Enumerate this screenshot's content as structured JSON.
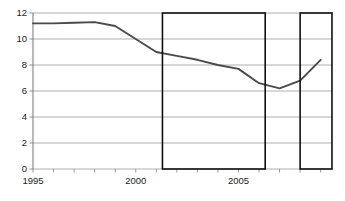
{
  "chart_data": {
    "type": "line",
    "title": "",
    "subtitle": "",
    "xlabel": "",
    "ylabel": "",
    "x": [
      1995,
      1996,
      1997,
      1998,
      1999,
      2000,
      2001,
      2002,
      2003,
      2004,
      2005,
      2006,
      2007,
      2008,
      2009
    ],
    "values": [
      11.2,
      11.2,
      11.25,
      11.3,
      11.0,
      10.0,
      9.0,
      8.7,
      8.4,
      8.0,
      7.7,
      6.6,
      6.2,
      6.8,
      8.4
    ],
    "series": [
      {
        "name": "series-1",
        "color": "#4a4a4a",
        "values": [
          11.2,
          11.2,
          11.25,
          11.3,
          11.0,
          10.0,
          9.0,
          8.7,
          8.4,
          8.0,
          7.7,
          6.6,
          6.2,
          6.8,
          8.4
        ]
      }
    ],
    "xlim": [
      1995,
      2009.6
    ],
    "ylim": [
      0,
      12
    ],
    "yticks": [
      0,
      2,
      4,
      6,
      8,
      10,
      12
    ],
    "ytick_labels": [
      "0",
      "2",
      "4",
      "6",
      "8",
      "10",
      "12"
    ],
    "xticks": [
      1995,
      1996,
      1997,
      1998,
      1999,
      2000,
      2001,
      2002,
      2003,
      2004,
      2005,
      2006,
      2007,
      2008,
      2009
    ],
    "xtick_labels_shown": [
      {
        "value": 1995,
        "label": "1995"
      },
      {
        "value": 2000,
        "label": "2000"
      },
      {
        "value": 2005,
        "label": "2005"
      }
    ],
    "grid": true,
    "grid_axis": "y",
    "grid_color": "#999999",
    "legend": false,
    "legend_position": "none",
    "annotations": [
      {
        "kind": "rectangle-highlight",
        "name": "highlight-box-1",
        "x_start": 2001.3,
        "x_end": 2006.3,
        "y_start": 0,
        "y_end": 12,
        "stroke": "#111111",
        "fill": "none"
      },
      {
        "kind": "rectangle-highlight",
        "name": "highlight-box-2",
        "x_start": 2008.0,
        "x_end": 2009.55,
        "y_start": 0,
        "y_end": 12,
        "stroke": "#111111",
        "fill": "none"
      }
    ],
    "axis_color": "#808080",
    "background": "#ffffff"
  }
}
